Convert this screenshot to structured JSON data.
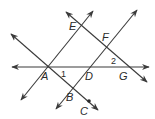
{
  "diagram": {
    "type": "geometry-lines",
    "stroke_color": "#3a3a3a",
    "background": "#ffffff",
    "points": {
      "A": {
        "label": "A",
        "x": 48,
        "y": 67,
        "label_x": 41,
        "label_y": 80
      },
      "B": {
        "label": "B",
        "x": 73,
        "y": 88,
        "label_x": 66,
        "label_y": 101
      },
      "C": {
        "label": "C",
        "x": 89,
        "y": 101,
        "label_x": 80,
        "label_y": 115
      },
      "D": {
        "label": "D",
        "x": 89,
        "y": 67,
        "label_x": 85,
        "label_y": 80
      },
      "E": {
        "label": "E",
        "x": 82,
        "y": 27,
        "label_x": 69,
        "label_y": 30
      },
      "F": {
        "label": "F",
        "x": 106,
        "y": 47,
        "label_x": 102,
        "label_y": 41
      },
      "G": {
        "label": "G",
        "x": 128,
        "y": 67,
        "label_x": 119,
        "label_y": 80
      }
    },
    "angles": [
      {
        "label": "1",
        "x": 61,
        "y": 77
      },
      {
        "label": "2",
        "x": 111,
        "y": 64
      }
    ],
    "lines": [
      {
        "name": "line-AG",
        "x1": 12,
        "y1": 67,
        "x2": 149,
        "y2": 67
      },
      {
        "name": "line-AE",
        "x1": 21,
        "y1": 100,
        "x2": 93,
        "y2": 11
      },
      {
        "name": "line-BF",
        "x1": 56,
        "y1": 109,
        "x2": 137,
        "y2": 10
      },
      {
        "name": "line-AC",
        "x1": 11,
        "y1": 34,
        "x2": 98,
        "y2": 110
      },
      {
        "name": "line-EG",
        "x1": 66,
        "y1": 12,
        "x2": 147,
        "y2": 82
      }
    ]
  }
}
